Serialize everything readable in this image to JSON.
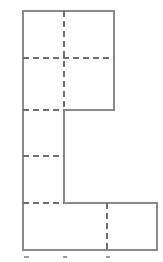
{
  "figure": {
    "kind": "geometric-line-drawing",
    "canvas": {
      "width": 163,
      "height": 262
    },
    "background_color": "#ffffff",
    "solid_line_color": "#8a8a8a",
    "dashed_line_color": "#6f6f6f",
    "solid_line_width": 1.15,
    "dashed_line_width": 1.05,
    "dash_pattern": "6 4",
    "outline": {
      "name": "stepped-l-polygon",
      "closed": true,
      "points": [
        [
          23,
          11
        ],
        [
          114,
          11
        ],
        [
          114,
          110
        ],
        [
          64,
          110
        ],
        [
          64,
          203
        ],
        [
          157,
          203
        ],
        [
          157,
          250
        ],
        [
          23,
          250
        ]
      ]
    },
    "solid_interior_segments": [
      {
        "name": "center-stem-lower",
        "x1": 64,
        "y1": 110,
        "x2": 64,
        "y2": 203
      }
    ],
    "dashed_horizontal_lines": [
      {
        "name": "upper-centerline",
        "y": 58,
        "x1": 23,
        "x2": 114
      },
      {
        "name": "mid-upper-centerline",
        "y": 110,
        "x1": 23,
        "x2": 64
      },
      {
        "name": "mid-lower-centerline",
        "y": 156,
        "x1": 23,
        "x2": 64
      },
      {
        "name": "lower-centerline",
        "y": 203,
        "x1": 23,
        "x2": 64
      }
    ],
    "dashed_vertical_lines": [
      {
        "name": "main-vertical-centerline",
        "x": 64,
        "y1": 11,
        "y2": 110
      },
      {
        "name": "bottom-right-centerline",
        "x": 107,
        "y1": 203,
        "y2": 250
      }
    ],
    "marks": [
      {
        "name": "bottom-tick-speck-left",
        "x": 24,
        "y": 256,
        "width": 5,
        "height": 2
      },
      {
        "name": "bottom-tick-speck-center",
        "x": 63,
        "y": 256,
        "width": 4,
        "height": 2
      },
      {
        "name": "bottom-tick-speck-right",
        "x": 106,
        "y": 256,
        "width": 4,
        "height": 2
      }
    ],
    "labels": []
  },
  "chart_data": {
    "type": "table",
    "title": "",
    "xlabel": "",
    "ylabel": "",
    "categories": [],
    "values": []
  }
}
